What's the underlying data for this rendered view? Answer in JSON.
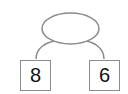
{
  "diagram": {
    "type": "number-bond",
    "whole": {
      "value": ""
    },
    "parts": [
      {
        "value": "8"
      },
      {
        "value": "6"
      }
    ],
    "colors": {
      "stroke": "#8c8c8c",
      "text": "#111111",
      "background": "#ffffff"
    }
  }
}
